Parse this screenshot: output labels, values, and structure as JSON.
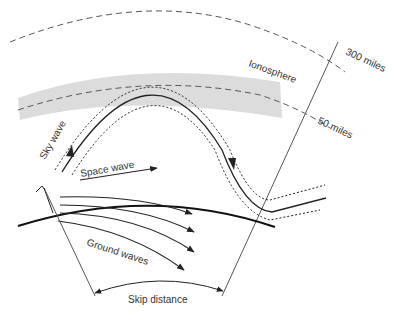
{
  "diagram": {
    "labels": {
      "ionosphere": "Ionosphere",
      "altitude_high": "300 miles",
      "altitude_low": "50 miles",
      "sky_wave": "Sky wave",
      "space_wave": "Space wave",
      "ground_waves": "Ground waves",
      "skip_distance": "Skip distance"
    },
    "colors": {
      "ink": "#222222",
      "text": "#333333",
      "dash": "#555555",
      "ionosphere_band": "#dcdcdc"
    }
  }
}
